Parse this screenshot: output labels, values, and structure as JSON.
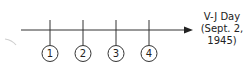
{
  "timeline": {
    "line_color": "#333333",
    "markers": [
      {
        "label": "1",
        "x": 50
      },
      {
        "label": "2",
        "x": 83
      },
      {
        "label": "3",
        "x": 116
      },
      {
        "label": "4",
        "x": 149
      }
    ],
    "end_label": {
      "line1": "V-J Day",
      "line2": "(Sept. 2,",
      "line3": "1945)"
    },
    "arrow_icon": "arrow-right-icon"
  }
}
